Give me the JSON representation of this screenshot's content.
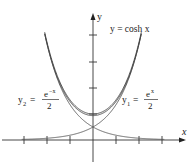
{
  "chart_data": {
    "type": "line",
    "title": "",
    "xlabel": "x",
    "ylabel": "y",
    "xlim": [
      -4,
      4
    ],
    "ylim": [
      0,
      4.5
    ],
    "x_ticks": [
      -3,
      -2,
      -1,
      1,
      2,
      3
    ],
    "y_ticks": [
      1,
      2,
      3,
      4
    ],
    "grid": false,
    "series": [
      {
        "name": "y = cosh x",
        "formula": "(e^x + e^-x)/2",
        "style": "bold",
        "x": [
          -2,
          -1,
          0,
          1,
          2
        ],
        "values": [
          3.76,
          1.54,
          1.0,
          1.54,
          3.76
        ]
      },
      {
        "name": "y1 = e^x/2",
        "formula": "e^x/2",
        "style": "thin",
        "x": [
          -3,
          -2,
          -1,
          0,
          1,
          2
        ],
        "values": [
          0.02,
          0.07,
          0.18,
          0.5,
          1.36,
          3.69
        ]
      },
      {
        "name": "y2 = e^-x/2",
        "formula": "e^-x/2",
        "style": "thin",
        "x": [
          -2,
          -1,
          0,
          1,
          2,
          3
        ],
        "values": [
          3.69,
          1.36,
          0.5,
          0.18,
          0.07,
          0.02
        ]
      }
    ],
    "annotations": [
      {
        "text": "y = cosh x",
        "near": "top-right of cosh curve"
      },
      {
        "text": "y2 = e^-x / 2",
        "near": "left curve"
      },
      {
        "text": "y1 = e^x / 2",
        "near": "right curve"
      }
    ]
  },
  "labels": {
    "x_axis": "x",
    "y_axis": "y",
    "cosh": "y = cosh x",
    "y1_lhs": "y",
    "y1_sub": "1",
    "y1_num": "e",
    "y1_exp": "x",
    "y1_den": "2",
    "y2_lhs": "y",
    "y2_sub": "2",
    "y2_num": "e",
    "y2_exp": "−x",
    "y2_den": "2",
    "eq": "="
  }
}
